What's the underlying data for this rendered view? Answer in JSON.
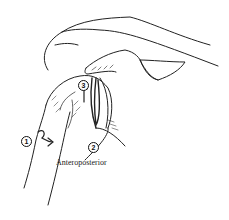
{
  "figure": {
    "caption": "Anteroposterior",
    "markers": [
      {
        "id": "1",
        "label": "1"
      },
      {
        "id": "2",
        "label": "2"
      },
      {
        "id": "3",
        "label": "3"
      }
    ],
    "colors": {
      "ink": "#111111",
      "background": "#ffffff"
    }
  }
}
